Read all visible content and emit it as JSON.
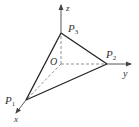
{
  "diagram": {
    "title": "",
    "colors": {
      "axis": "#444444",
      "edge": "#222222",
      "dashed": "#777777",
      "text": "#333333",
      "background": "#ffffff"
    },
    "axes": {
      "x": {
        "label": "x"
      },
      "y": {
        "label": "y"
      },
      "z": {
        "label": "z"
      }
    },
    "origin": {
      "label": "O"
    },
    "points": [
      {
        "id": "P1",
        "base": "P",
        "sub": "1",
        "on_axis": "x"
      },
      {
        "id": "P2",
        "base": "P",
        "sub": "2",
        "on_axis": "y"
      },
      {
        "id": "P3",
        "base": "P",
        "sub": "3",
        "on_axis": "z"
      }
    ],
    "solid_edges": [
      "P1-P2",
      "P2-P3",
      "P3-P1"
    ],
    "dashed_edges": [
      "O-P1",
      "O-P2",
      "O-P3"
    ]
  }
}
